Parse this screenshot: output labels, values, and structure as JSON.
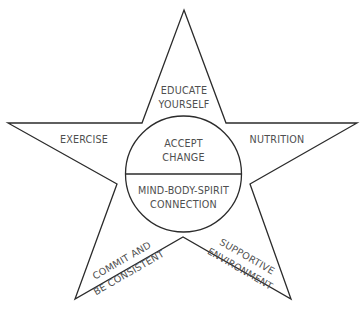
{
  "diagram": {
    "type": "star",
    "center": {
      "top_label": [
        "ACCEPT",
        "CHANGE"
      ],
      "bottom_label": [
        "MIND-BODY-SPIRIT",
        "CONNECTION"
      ]
    },
    "points": {
      "top": [
        "EDUCATE",
        "YOURSELF"
      ],
      "left": [
        "EXERCISE"
      ],
      "right": [
        "NUTRITION"
      ],
      "bottom_left": [
        "COMMIT AND",
        "BE CONSISTENT"
      ],
      "bottom_right": [
        "SUPPORTIVE",
        "ENVIRONMENT"
      ]
    },
    "colors": {
      "line": "#2b2b2b",
      "text": "#4f4f4f",
      "background": "#ffffff"
    }
  }
}
